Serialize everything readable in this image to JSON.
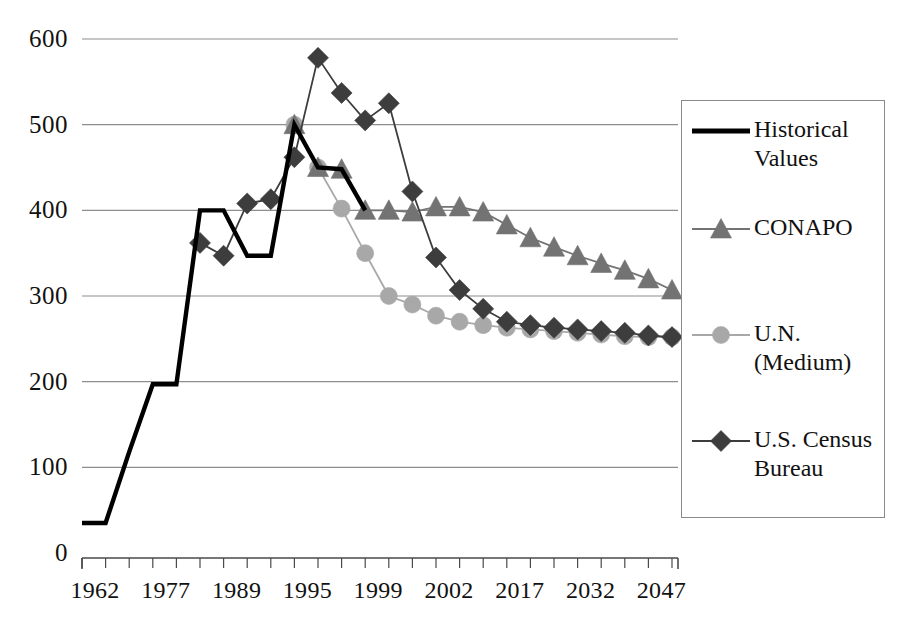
{
  "chart_data": {
    "type": "line",
    "title": "",
    "xlabel": "",
    "ylabel": "",
    "ylim": [
      0,
      600
    ],
    "y_ticks": [
      0,
      100,
      200,
      300,
      400,
      500,
      600
    ],
    "grid": true,
    "legend_position": "right",
    "x_tick_labels": [
      "1962",
      "1977",
      "1989",
      "1995",
      "1999",
      "2002",
      "2017",
      "2032",
      "2047"
    ],
    "x_tick_label_indices": [
      0,
      3,
      6,
      9,
      12,
      15,
      18,
      21,
      24
    ],
    "x_tick_count": 26,
    "x": [
      0,
      1,
      2,
      3,
      4,
      5,
      6,
      7,
      8,
      9,
      10,
      11,
      12,
      13,
      14,
      15,
      16,
      17,
      18,
      19,
      20,
      21,
      22,
      23,
      24,
      25
    ],
    "series": [
      {
        "name": "Historical Values",
        "marker": "none",
        "color": "#000000",
        "line_width": 4.4,
        "x": [
          0,
          1,
          2,
          3,
          4,
          5,
          6,
          7,
          8,
          9,
          10,
          11,
          12
        ],
        "values": [
          35,
          35,
          118,
          197,
          197,
          400,
          400,
          347,
          347,
          500,
          450,
          448,
          400
        ]
      },
      {
        "name": "CONAPO",
        "marker": "triangle",
        "color": "#737373",
        "line_width": 1.8,
        "x": [
          9,
          10,
          11,
          12,
          13,
          14,
          15,
          16,
          17,
          18,
          19,
          20,
          21,
          22,
          23,
          24,
          25
        ],
        "values": [
          500,
          450,
          448,
          400,
          400,
          398,
          404,
          404,
          398,
          383,
          368,
          357,
          347,
          338,
          330,
          320,
          307
        ]
      },
      {
        "name": "U.N. (Medium)",
        "marker": "circle",
        "color": "#a8a8a8",
        "line_width": 1.8,
        "x": [
          9,
          10,
          11,
          12,
          13,
          14,
          15,
          16,
          17,
          18,
          19,
          20,
          21,
          22,
          23,
          24,
          25
        ],
        "values": [
          500,
          450,
          402,
          350,
          300,
          290,
          277,
          270,
          266,
          263,
          261,
          259,
          257,
          255,
          253,
          252,
          252
        ]
      },
      {
        "name": "U.S. Census Bureau",
        "marker": "diamond",
        "color": "#3d3d3d",
        "line_width": 1.8,
        "x": [
          5,
          6,
          7,
          8,
          9,
          10,
          11,
          12,
          13,
          14,
          15,
          16,
          17,
          18,
          19,
          20,
          21,
          22,
          23,
          24,
          25
        ],
        "values": [
          362,
          347,
          408,
          413,
          462,
          578,
          537,
          505,
          525,
          422,
          345,
          307,
          285,
          270,
          266,
          263,
          261,
          259,
          257,
          254,
          252
        ]
      }
    ]
  },
  "legend": {
    "entries": [
      {
        "label": "Historical\nValues",
        "key": "line-thick",
        "name": "legend-item-historical-values"
      },
      {
        "label": "CONAPO",
        "key": "line-triangle",
        "name": "legend-item-conapo"
      },
      {
        "label": "U.N.\n(Medium)",
        "key": "line-circle",
        "name": "legend-item-un-medium"
      },
      {
        "label": "U.S. Census\nBureau",
        "key": "line-diamond",
        "name": "legend-item-us-census-bureau"
      }
    ]
  },
  "colors": {
    "historical": "#000000",
    "conapo": "#737373",
    "un": "#a8a8a8",
    "census": "#3d3d3d",
    "grid": "#8d8d8d",
    "axis": "#4a4a4a",
    "text": "#111111"
  }
}
